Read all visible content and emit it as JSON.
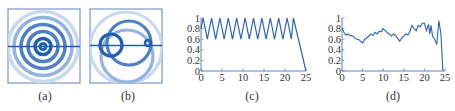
{
  "figure": {
    "captions": [
      "(a)",
      "(b)",
      "(c)",
      "(d)"
    ],
    "colors": {
      "dark": "#1f5fb0",
      "medium": "#4f7fc4",
      "light": "#93b3e0",
      "faint": "#c9d9f0",
      "axis": "#5b82c2",
      "line": "#2d64b4"
    }
  },
  "panel_a": {
    "type": "diagram",
    "description": "concentric rings with horizontal line",
    "rings": [
      {
        "r": 3,
        "shade": "dark"
      },
      {
        "r": 8,
        "shade": "dark"
      },
      {
        "r": 15,
        "shade": "medium"
      },
      {
        "r": 22,
        "shade": "medium"
      },
      {
        "r": 29,
        "shade": "light"
      },
      {
        "r": 35,
        "shade": "faint"
      }
    ]
  },
  "panel_b": {
    "type": "diagram",
    "description": "overlapping offset rings with horizontal line",
    "rings": [
      {
        "cx": 126,
        "cy": 48,
        "r": 36,
        "shade": "faint"
      },
      {
        "cx": 127,
        "cy": 56,
        "r": 26,
        "shade": "light"
      },
      {
        "cx": 129,
        "cy": 43,
        "r": 22,
        "shade": "medium"
      },
      {
        "cx": 111,
        "cy": 45,
        "r": 11,
        "shade": "dark"
      },
      {
        "cx": 148,
        "cy": 43,
        "r": 3,
        "shade": "dark"
      }
    ]
  },
  "chart_data": [
    {
      "id": "c",
      "type": "line",
      "title": "",
      "caption": "(c)",
      "xlabel": "",
      "ylabel": "",
      "xlim": [
        0,
        25
      ],
      "ylim": [
        0,
        1
      ],
      "xticks": [
        "0",
        "5",
        "10",
        "15",
        "20",
        "25"
      ],
      "yticks": [
        "0",
        "0.2",
        "0.4",
        "0.6",
        "0.8",
        "1"
      ],
      "grid": false,
      "x": [
        0,
        0.5,
        1.5,
        2.5,
        3.5,
        4.5,
        5.5,
        6.5,
        7.5,
        8.5,
        9.5,
        10.5,
        11.5,
        12.5,
        13.5,
        14.5,
        15.5,
        16.5,
        17.5,
        18.5,
        19.5,
        20.5,
        21.5,
        22.0,
        25.0
      ],
      "values": [
        0.8,
        1.0,
        0.6,
        1.0,
        0.6,
        1.0,
        0.6,
        1.0,
        0.6,
        1.0,
        0.6,
        1.0,
        0.6,
        1.0,
        0.6,
        1.0,
        0.6,
        1.0,
        0.6,
        1.0,
        0.6,
        1.0,
        0.6,
        1.0,
        0.0
      ]
    },
    {
      "id": "d",
      "type": "line",
      "title": "",
      "caption": "(d)",
      "xlabel": "",
      "ylabel": "",
      "xlim": [
        0,
        25
      ],
      "ylim": [
        0,
        1
      ],
      "xticks": [
        "0",
        "5",
        "10",
        "15",
        "20",
        "25"
      ],
      "yticks": [
        "0",
        "0.2",
        "0.4",
        "0.6",
        "0.8",
        "1"
      ],
      "grid": false,
      "x": [
        0,
        0.5,
        1,
        1.5,
        2,
        2.5,
        3,
        3.5,
        4,
        4.5,
        5,
        5.5,
        6,
        6.5,
        7,
        7.5,
        8,
        8.5,
        9,
        9.5,
        10,
        10.5,
        11,
        11.5,
        12,
        12.5,
        13,
        13.5,
        14,
        14.5,
        15,
        15.5,
        16,
        16.5,
        17,
        17.5,
        18,
        18.5,
        19,
        19.5,
        20,
        20.5,
        21,
        21.3,
        21.6,
        22,
        22.5,
        23,
        23.5,
        24,
        24.5
      ],
      "values": [
        0.8,
        0.72,
        0.68,
        0.7,
        0.66,
        0.67,
        0.63,
        0.6,
        0.6,
        0.56,
        0.53,
        0.6,
        0.62,
        0.66,
        0.7,
        0.67,
        0.73,
        0.7,
        0.75,
        0.74,
        0.8,
        0.76,
        0.72,
        0.7,
        0.66,
        0.7,
        0.67,
        0.62,
        0.56,
        0.62,
        0.66,
        0.7,
        0.68,
        0.75,
        0.86,
        0.8,
        0.76,
        0.86,
        0.83,
        0.9,
        0.9,
        0.76,
        0.88,
        0.7,
        0.86,
        0.65,
        0.6,
        0.5,
        0.95,
        0.7,
        0.0
      ]
    }
  ]
}
